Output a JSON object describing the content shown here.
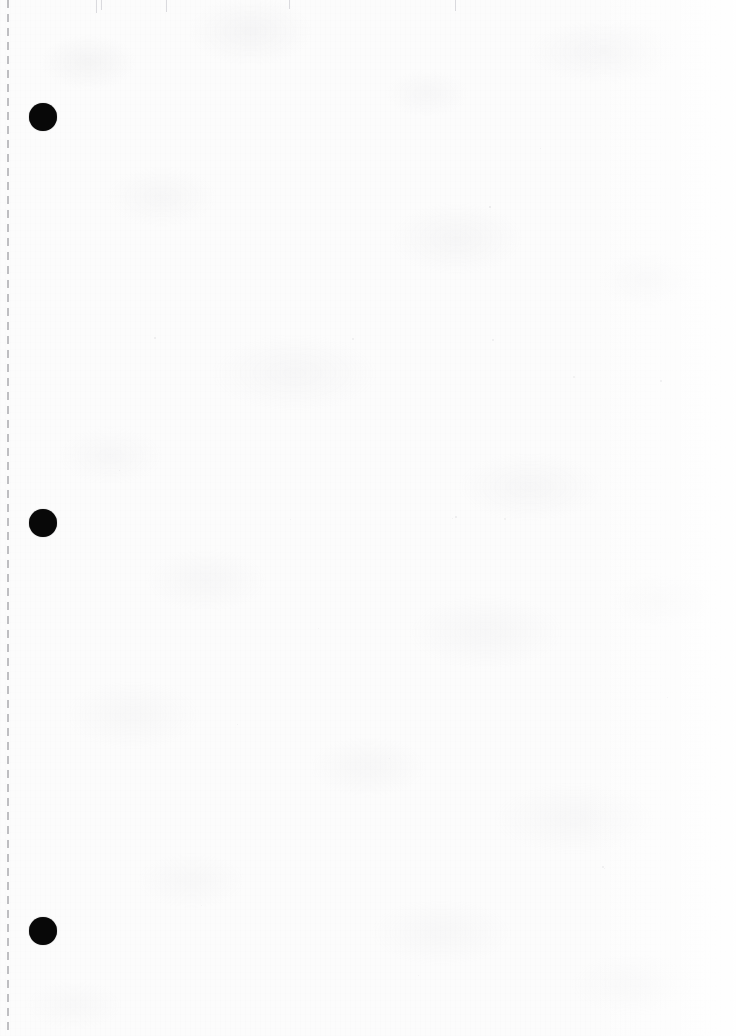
{
  "document": {
    "type": "scanned-page",
    "title": "Scanned blank page",
    "description": "Blank scanned sheet of paper with a vertical dashed perforation line along the left edge and three punched holes.",
    "page_text": "",
    "width_px": 736,
    "height_px": 1036,
    "orientation": "portrait"
  },
  "paper": {
    "base_color": "#fcfcfc",
    "texture_tint": "#cdcdd2",
    "edge_highlight": "#ffffff"
  },
  "perforation": {
    "name": "tear-line",
    "edge": "left",
    "x_px": 7,
    "color": "#8c8c92",
    "dash_length_px": 8,
    "gap_length_px": 6
  },
  "hole_punches": {
    "count": 3,
    "color": "#080808",
    "diameter_px": 28,
    "items": [
      {
        "label": "hole-1",
        "x_px": 43,
        "y_px": 117
      },
      {
        "label": "hole-2",
        "x_px": 43,
        "y_px": 523
      },
      {
        "label": "hole-3",
        "x_px": 43,
        "y_px": 931
      }
    ]
  },
  "specks": [
    {
      "x_px": 154,
      "y_px": 337,
      "size_px": 2,
      "opacity": 0.3
    },
    {
      "x_px": 352,
      "y_px": 338,
      "size_px": 2,
      "opacity": 0.26
    },
    {
      "x_px": 489,
      "y_px": 206,
      "size_px": 2,
      "opacity": 0.34
    },
    {
      "x_px": 492,
      "y_px": 339,
      "size_px": 2,
      "opacity": 0.28
    },
    {
      "x_px": 573,
      "y_px": 376,
      "size_px": 2,
      "opacity": 0.24
    },
    {
      "x_px": 660,
      "y_px": 380,
      "size_px": 2,
      "opacity": 0.26
    },
    {
      "x_px": 455,
      "y_px": 516,
      "size_px": 2,
      "opacity": 0.3
    },
    {
      "x_px": 504,
      "y_px": 518,
      "size_px": 2,
      "opacity": 0.24
    },
    {
      "x_px": 452,
      "y_px": 518,
      "size_px": 1,
      "opacity": 0.22
    },
    {
      "x_px": 290,
      "y_px": 519,
      "size_px": 1,
      "opacity": 0.2
    },
    {
      "x_px": 602,
      "y_px": 866,
      "size_px": 2,
      "opacity": 0.26
    },
    {
      "x_px": 604,
      "y_px": 868,
      "size_px": 1,
      "opacity": 0.22
    },
    {
      "x_px": 237,
      "y_px": 724,
      "size_px": 1,
      "opacity": 0.22
    },
    {
      "x_px": 389,
      "y_px": 758,
      "size_px": 1,
      "opacity": 0.2
    },
    {
      "x_px": 667,
      "y_px": 697,
      "size_px": 1,
      "opacity": 0.2
    },
    {
      "x_px": 119,
      "y_px": 470,
      "size_px": 1,
      "opacity": 0.22
    },
    {
      "x_px": 318,
      "y_px": 628,
      "size_px": 1,
      "opacity": 0.2
    },
    {
      "x_px": 540,
      "y_px": 148,
      "size_px": 1,
      "opacity": 0.22
    },
    {
      "x_px": 201,
      "y_px": 905,
      "size_px": 1,
      "opacity": 0.2
    },
    {
      "x_px": 418,
      "y_px": 975,
      "size_px": 1,
      "opacity": 0.2
    }
  ],
  "edge_ticks": [
    {
      "x_px": 96,
      "height_px": 13
    },
    {
      "x_px": 101,
      "height_px": 10
    },
    {
      "x_px": 166,
      "height_px": 12
    },
    {
      "x_px": 289,
      "height_px": 9
    },
    {
      "x_px": 455,
      "height_px": 11
    }
  ]
}
